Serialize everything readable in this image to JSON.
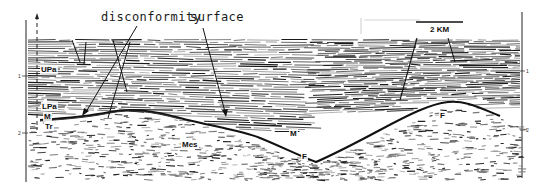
{
  "figure": {
    "type": "seismic-reflection-profile",
    "annotations": {
      "disconformity": "disconformity",
      "surface": "surface"
    },
    "scale_bar": {
      "label": "2 KM"
    },
    "axis": {
      "left_ticks": [
        "1",
        "2"
      ],
      "right_ticks": [
        "1",
        "2"
      ]
    },
    "units": {
      "upa": "UPa",
      "lpa": "LPa",
      "m_left": "M",
      "tr": "Tr",
      "mes": "Mes",
      "m_center": "M",
      "f_bottom": "F",
      "f_right": "F"
    },
    "colors": {
      "background": "#ffffff",
      "reflector": "#1a1a1a",
      "noise": "#555555"
    }
  }
}
